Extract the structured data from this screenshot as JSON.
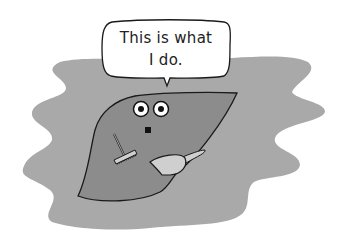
{
  "illustration": {
    "subject": "cartoon liver character holding a brush and dustpan",
    "speech_bubble": {
      "line1": "This is what",
      "line2": "I do."
    },
    "colors": {
      "background": "#ffffff",
      "blob": "#a9a9a9",
      "liver": "#8c8c8c",
      "outline": "#1a1a1a",
      "tool_fill": "#cfcfcf",
      "eye_white": "#ffffff"
    },
    "icons": [
      "speech-bubble",
      "liver-character",
      "brush",
      "dustpan"
    ]
  }
}
